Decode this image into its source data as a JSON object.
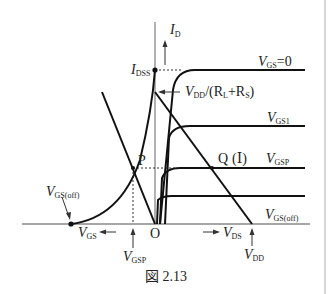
{
  "figure": {
    "caption": "図 2.13",
    "axes": {
      "y_label": "I",
      "y_label_sub": "D",
      "x_right_label": "V",
      "x_right_label_sub": "DS",
      "x_left_label": "V",
      "x_left_label_sub": "GS",
      "origin": "O"
    },
    "points": {
      "idss": {
        "label": "I",
        "sub": "DSS"
      },
      "p": {
        "label": "P"
      },
      "q": {
        "label": "Q"
      },
      "vgs_off_left": {
        "label": "V",
        "sub": "GS(off)"
      },
      "vgsp_bottom": {
        "label": "V",
        "sub": "GSP"
      },
      "vdd_bottom": {
        "label": "V",
        "sub": "DD"
      }
    },
    "load_line_label": {
      "v": "V",
      "v_sub": "DD",
      "mid": "/(R",
      "r1_sub": "L",
      "plus": "+R",
      "r2_sub": "S",
      "end": ")"
    },
    "curves": [
      {
        "label": "V",
        "sub": "GS",
        "suffix": "=0"
      },
      {
        "label": "V",
        "sub": "GS1",
        "suffix": ""
      },
      {
        "label": "V",
        "sub": "GSP",
        "suffix": "",
        "prefix": "(Ⅰ)"
      },
      {
        "label": "V",
        "sub": "GS(off)",
        "suffix": ""
      }
    ]
  }
}
